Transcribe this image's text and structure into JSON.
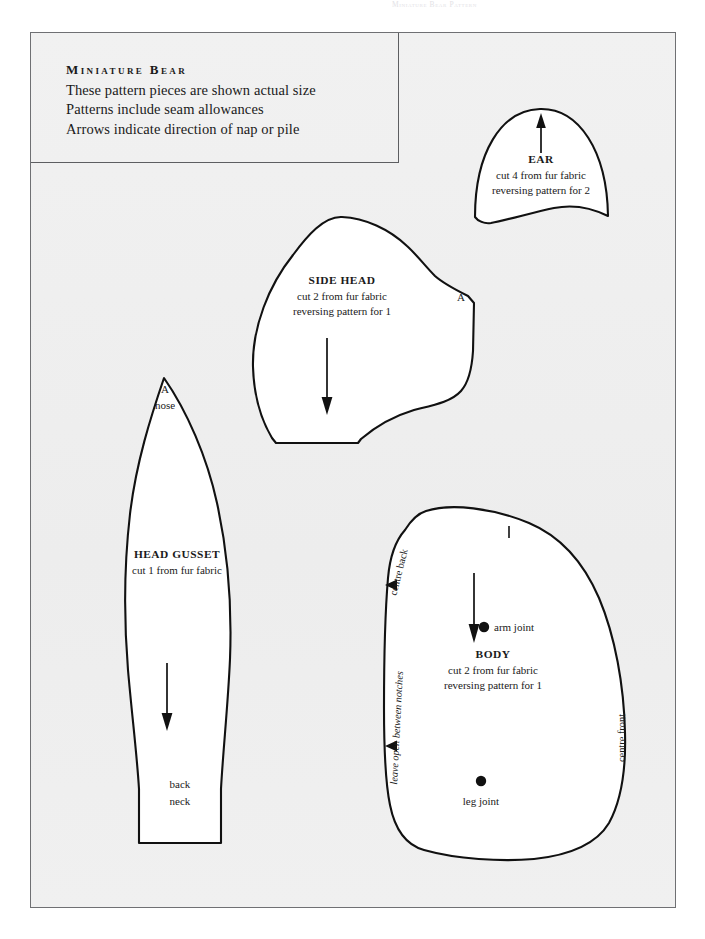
{
  "document": {
    "running_header": "Miniature Bear Pattern",
    "page_background": "#ffffff",
    "sheet_background": "#efefef",
    "ink_color": "#111111"
  },
  "title_block": {
    "heading": "Miniature Bear",
    "lines": [
      "These pattern pieces are shown actual size",
      "Patterns include seam allowances",
      "Arrows indicate direction of nap or pile"
    ]
  },
  "pieces": {
    "ear": {
      "name": "EAR",
      "cut_line": "cut 4 from fur fabric",
      "reverse_line": "reversing pattern for 2",
      "nap_arrow": "up"
    },
    "side_head": {
      "name": "SIDE HEAD",
      "cut_line": "cut 2 from fur fabric",
      "reverse_line": "reversing pattern for 1",
      "match_point": "A",
      "nap_arrow": "down"
    },
    "head_gusset": {
      "name": "HEAD GUSSET",
      "cut_line": "cut 1 from fur fabric",
      "match_point": "A",
      "nose_label": "nose",
      "back_label": "back",
      "neck_label": "neck",
      "nap_arrow": "down"
    },
    "body": {
      "name": "BODY",
      "cut_line": "cut 2 from fur fabric",
      "reverse_line": "reversing pattern for 1",
      "centre_back_label": "centre back",
      "centre_front_label": "centre front",
      "leave_open_label": "leave open between notches",
      "arm_joint_label": "arm joint",
      "leg_joint_label": "leg joint",
      "nap_arrow": "down"
    }
  }
}
